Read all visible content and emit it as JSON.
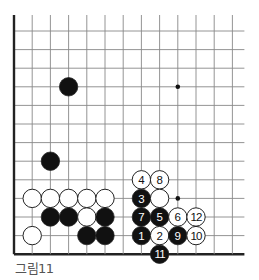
{
  "diagram": {
    "caption": "그림11",
    "grid": {
      "columns": 13,
      "rows": 13,
      "origin_x": 14,
      "origin_y": 31,
      "spacing_x": 18.2,
      "spacing_y": 18.6,
      "right_extend": 12,
      "top_extend": 16,
      "left_border": true,
      "bottom_border": true,
      "line_color": "#888888",
      "border_color": "#222222"
    },
    "star_points": [
      {
        "col": 9,
        "row": 3
      },
      {
        "col": 9,
        "row": 9
      }
    ],
    "stones": [
      {
        "color": "black",
        "col": 3,
        "row": 3,
        "label": ""
      },
      {
        "color": "black",
        "col": 2,
        "row": 7,
        "label": ""
      },
      {
        "color": "white",
        "col": 1,
        "row": 9,
        "label": ""
      },
      {
        "color": "white",
        "col": 2,
        "row": 9,
        "label": ""
      },
      {
        "color": "white",
        "col": 3,
        "row": 9,
        "label": ""
      },
      {
        "color": "white",
        "col": 4,
        "row": 9,
        "label": ""
      },
      {
        "color": "white",
        "col": 5,
        "row": 9,
        "label": ""
      },
      {
        "color": "black",
        "col": 2,
        "row": 10,
        "label": ""
      },
      {
        "color": "black",
        "col": 3,
        "row": 10,
        "label": ""
      },
      {
        "color": "white",
        "col": 4,
        "row": 10,
        "label": ""
      },
      {
        "color": "black",
        "col": 5,
        "row": 10,
        "label": ""
      },
      {
        "color": "white",
        "col": 1,
        "row": 11,
        "label": ""
      },
      {
        "color": "black",
        "col": 4,
        "row": 11,
        "label": ""
      },
      {
        "color": "black",
        "col": 5,
        "row": 11,
        "label": ""
      },
      {
        "color": "white",
        "col": 7,
        "row": 8,
        "label": "4"
      },
      {
        "color": "white",
        "col": 8,
        "row": 8,
        "label": "8"
      },
      {
        "color": "black",
        "col": 7,
        "row": 9,
        "label": "3"
      },
      {
        "color": "white",
        "col": 8,
        "row": 9,
        "label": ""
      },
      {
        "color": "black",
        "col": 7,
        "row": 10,
        "label": "7"
      },
      {
        "color": "black",
        "col": 8,
        "row": 10,
        "label": "5"
      },
      {
        "color": "white",
        "col": 9,
        "row": 10,
        "label": "6"
      },
      {
        "color": "white",
        "col": 10,
        "row": 10,
        "label": "12"
      },
      {
        "color": "black",
        "col": 7,
        "row": 11,
        "label": "1"
      },
      {
        "color": "white",
        "col": 8,
        "row": 11,
        "label": "2"
      },
      {
        "color": "black",
        "col": 9,
        "row": 11,
        "label": "9"
      },
      {
        "color": "white",
        "col": 10,
        "row": 11,
        "label": "10"
      },
      {
        "color": "black",
        "col": 8,
        "row": 12,
        "label": "11"
      }
    ],
    "stone_radius": 9.2,
    "colors": {
      "black_stone": "#111111",
      "white_stone": "#ffffff",
      "stone_outline": "#222222",
      "caption": "#555555"
    }
  }
}
